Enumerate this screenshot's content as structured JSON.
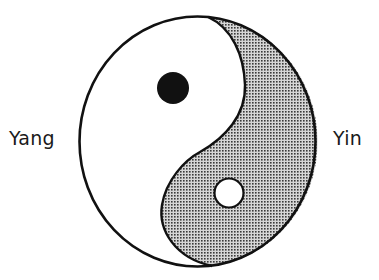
{
  "diagram": {
    "labels": {
      "left": "Yang",
      "right": "Yin"
    },
    "colors": {
      "outline": "#111111",
      "yang_fill": "#ffffff",
      "yin_fill_base": "#c8c8c8",
      "yin_dot_pattern": "#3a3a3a",
      "yang_dot": "#111111",
      "yin_dot": "#ffffff"
    },
    "regions": [
      {
        "name": "yang",
        "side": "left",
        "fill": "white",
        "contains_dot": "black"
      },
      {
        "name": "yin",
        "side": "right",
        "fill": "stippled gray",
        "contains_dot": "white"
      }
    ]
  }
}
